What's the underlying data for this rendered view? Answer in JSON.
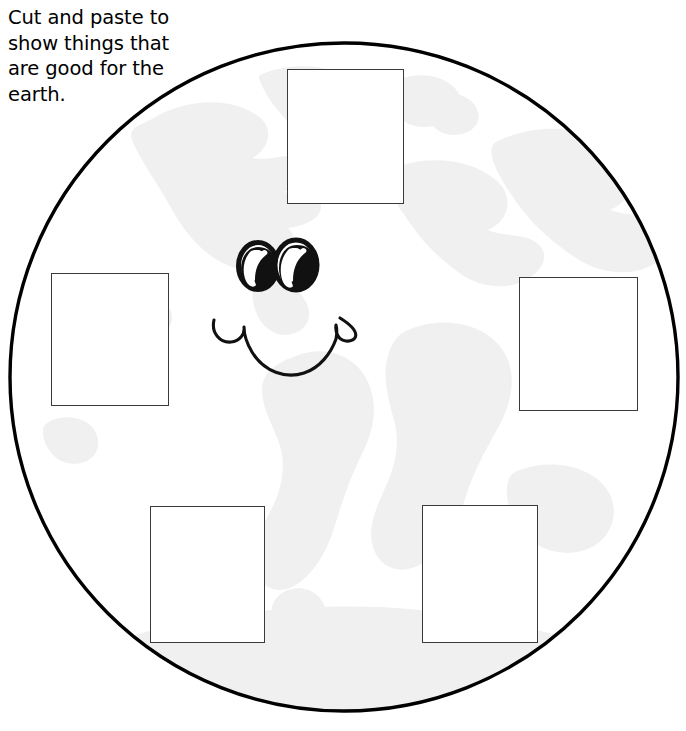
{
  "worksheet": {
    "title": "Cut and paste to show things that are good for the earth.",
    "instruction": "Cut and paste to\nshow things that\nare good for the\nearth.",
    "background_color": "#ffffff",
    "width": 686,
    "height": 731
  },
  "earth": {
    "label": "earth-globe",
    "outline_color": "#000000",
    "fill_color": "#ffffff",
    "continent_color": "#f0f0f0",
    "center_x": 344,
    "center_y": 377,
    "radius": 335,
    "stroke_width": 3.4
  },
  "face": {
    "label": "smiley-face",
    "ink_color": "#111111",
    "eye_left": {
      "cx": 258,
      "cy": 266,
      "rx": 19,
      "ry": 23
    },
    "eye_right": {
      "cx": 296,
      "cy": 265,
      "rx": 21,
      "ry": 25
    },
    "mouth": {
      "left_x": 213,
      "right_x": 340,
      "top_y": 318,
      "bottom_y": 375
    }
  },
  "paste_boxes": [
    {
      "id": "top",
      "name": "paste-box-top",
      "label": "",
      "x": 287,
      "y": 69,
      "width": 117,
      "height": 135
    },
    {
      "id": "left",
      "name": "paste-box-left",
      "label": "",
      "x": 51,
      "y": 273,
      "width": 118,
      "height": 133
    },
    {
      "id": "right",
      "name": "paste-box-right",
      "label": "",
      "x": 519,
      "y": 277,
      "width": 119,
      "height": 134
    },
    {
      "id": "bottom-left",
      "name": "paste-box-bottom-left",
      "label": "",
      "x": 150,
      "y": 506,
      "width": 115,
      "height": 137
    },
    {
      "id": "bottom-right",
      "name": "paste-box-bottom-right",
      "label": "",
      "x": 422,
      "y": 505,
      "width": 116,
      "height": 138
    }
  ]
}
